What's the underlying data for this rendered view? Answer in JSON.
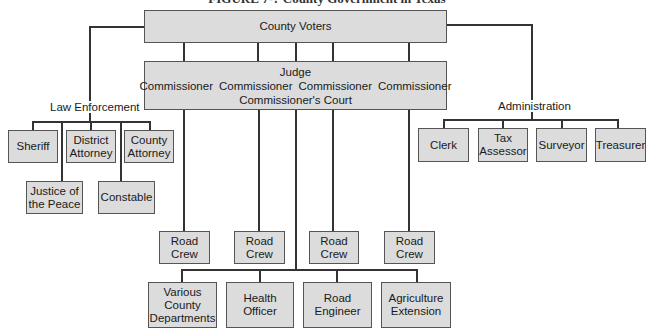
{
  "title": "FIGURE 7-? County Government in Texas",
  "top": {
    "label": "County Voters"
  },
  "court": {
    "judge": "Judge",
    "commissioners": [
      "Commissioner",
      "Commissioner",
      "Commissioner",
      "Commissioner"
    ],
    "court_name": "Commissioner's Court"
  },
  "law_enforcement": {
    "label": "Law Enforcement",
    "row1": [
      {
        "lines": [
          "Sheriff"
        ]
      },
      {
        "lines": [
          "District",
          "Attorney"
        ]
      },
      {
        "lines": [
          "County",
          "Attorney"
        ]
      }
    ],
    "row2": [
      {
        "lines": [
          "Justice of",
          "the Peace"
        ]
      },
      {
        "lines": [
          "Constable"
        ]
      }
    ]
  },
  "administration": {
    "label": "Administration",
    "items": [
      {
        "lines": [
          "Clerk"
        ]
      },
      {
        "lines": [
          "Tax",
          "Assessor"
        ]
      },
      {
        "lines": [
          "Surveyor"
        ]
      },
      {
        "lines": [
          "Treasurer"
        ]
      }
    ]
  },
  "road_crews": [
    {
      "lines": [
        "Road",
        "Crew"
      ]
    },
    {
      "lines": [
        "Road",
        "Crew"
      ]
    },
    {
      "lines": [
        "Road",
        "Crew"
      ]
    },
    {
      "lines": [
        "Road",
        "Crew"
      ]
    }
  ],
  "departments": [
    {
      "lines": [
        "Various",
        "County",
        "Departments"
      ]
    },
    {
      "lines": [
        "Health",
        "Officer"
      ]
    },
    {
      "lines": [
        "Road",
        "Engineer"
      ]
    },
    {
      "lines": [
        "Agriculture",
        "Extension"
      ]
    }
  ],
  "colors": {
    "box_fill": "#dcdcdc",
    "line": "#333333",
    "text": "#1a1a1a"
  }
}
